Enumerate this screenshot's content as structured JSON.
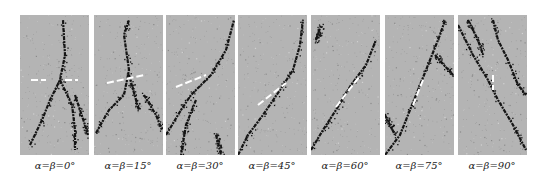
{
  "figure": {
    "panels": [
      {
        "label": "α=β=0°",
        "angle_deg": 0
      },
      {
        "label": "α=β=15°",
        "angle_deg": 15
      },
      {
        "label": "α=β=30°",
        "angle_deg": 30
      },
      {
        "label": "α=β=45°",
        "angle_deg": 45
      },
      {
        "label": "α=β=60°",
        "angle_deg": 60
      },
      {
        "label": "α=β=75°",
        "angle_deg": 75
      },
      {
        "label": "α=β=90°",
        "angle_deg": 90
      }
    ],
    "colors": {
      "background": "#b4b4b4",
      "crack": "#151515",
      "flaw": "#ffffff"
    }
  }
}
